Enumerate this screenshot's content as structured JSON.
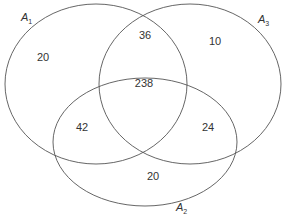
{
  "diagram": {
    "type": "venn",
    "stroke_color": "#555555",
    "sets": [
      {
        "id": "A1",
        "label": "A",
        "subscript": "1"
      },
      {
        "id": "A2",
        "label": "A",
        "subscript": "2"
      },
      {
        "id": "A3",
        "label": "A",
        "subscript": "3"
      }
    ],
    "regions": {
      "a1_only": "20",
      "a3_only": "10",
      "a2_only": "20",
      "a1_a3": "36",
      "a1_a2_a3": "238",
      "a1_a2": "42",
      "a2_a3": "24"
    }
  }
}
